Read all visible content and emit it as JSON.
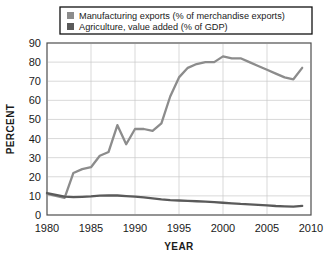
{
  "chart_data": {
    "type": "line",
    "title": "",
    "xlabel": "YEAR",
    "ylabel": "PERCENT",
    "xlim": [
      1980,
      2010
    ],
    "ylim": [
      0,
      90
    ],
    "xticks": [
      "1980",
      "1985",
      "1990",
      "1995",
      "2000",
      "2005",
      "2010"
    ],
    "yticks": [
      "0",
      "10",
      "20",
      "30",
      "40",
      "50",
      "60",
      "70",
      "80",
      "90"
    ],
    "grid": true,
    "legend_position": "top-center",
    "x": [
      1980,
      1981,
      1982,
      1983,
      1984,
      1985,
      1986,
      1987,
      1988,
      1989,
      1990,
      1991,
      1992,
      1993,
      1994,
      1995,
      1996,
      1997,
      1998,
      1999,
      2000,
      2001,
      2002,
      2003,
      2004,
      2005,
      2006,
      2007,
      2008,
      2009
    ],
    "series": [
      {
        "name": "Manufacturing exports (% of merchandise exports)",
        "color": "#8c8c8c",
        "values": [
          11,
          10,
          9,
          22,
          24,
          25,
          31,
          33,
          47,
          37,
          45,
          45,
          44,
          48,
          62,
          72,
          77,
          79,
          80,
          80,
          83,
          82,
          82,
          80,
          78,
          76,
          74,
          72,
          71,
          77
        ]
      },
      {
        "name": "Agriculture, value added (% of GDP)",
        "color": "#5a5a5a",
        "values": [
          11.5,
          10.5,
          9.6,
          9.4,
          9.5,
          9.7,
          10.1,
          10.3,
          10.2,
          9.9,
          9.6,
          9.2,
          8.7,
          8.2,
          7.8,
          7.6,
          7.4,
          7.2,
          7.0,
          6.7,
          6.4,
          6.1,
          5.8,
          5.6,
          5.3,
          5.0,
          4.7,
          4.5,
          4.4,
          4.8
        ]
      }
    ]
  },
  "legend": {
    "items": [
      {
        "label": "Manufacturing exports (% of merchandise exports)",
        "color": "#8c8c8c"
      },
      {
        "label": "Agriculture, value added (% of GDP)",
        "color": "#5a5a5a"
      }
    ]
  }
}
